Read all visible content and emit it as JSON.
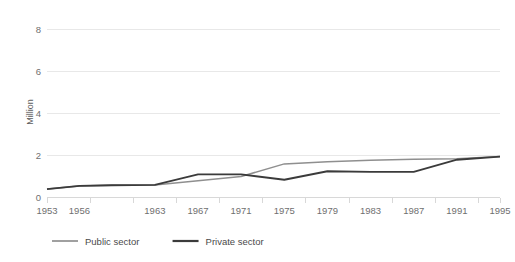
{
  "chart_data": {
    "type": "line",
    "title": "",
    "subtitle": "",
    "xlabel": "",
    "ylabel": "Million",
    "ylim": [
      0,
      8
    ],
    "yticks": [
      0,
      2,
      4,
      6,
      8
    ],
    "ytick_labels": [
      "0",
      "2",
      "4",
      "6",
      "8"
    ],
    "grid": true,
    "legend_position": "bottom-left",
    "x": [
      1953,
      1956,
      1959,
      1963,
      1967,
      1971,
      1975,
      1979,
      1983,
      1987,
      1991,
      1995
    ],
    "xtick_labels": [
      "1953",
      "1956",
      "1963",
      "1967",
      "1971",
      "1975",
      "1979",
      "1983",
      "1987",
      "1991",
      "1995"
    ],
    "xtick_values": [
      1953,
      1956,
      1963,
      1967,
      1971,
      1975,
      1979,
      1983,
      1987,
      1991,
      1995
    ],
    "series": [
      {
        "name": "Public sector",
        "color": "#8f8f8f",
        "values": [
          0.4,
          0.55,
          0.58,
          0.6,
          0.8,
          1.0,
          1.6,
          1.7,
          1.77,
          1.82,
          1.85,
          1.95
        ]
      },
      {
        "name": "Private sector",
        "color": "#3b3b3b",
        "values": [
          0.4,
          0.55,
          0.58,
          0.6,
          1.1,
          1.1,
          0.85,
          1.25,
          1.22,
          1.22,
          1.8,
          1.95
        ]
      }
    ]
  },
  "legend": {
    "items": [
      {
        "label": "Public sector",
        "color": "#8f8f8f"
      },
      {
        "label": "Private sector",
        "color": "#3b3b3b"
      }
    ]
  },
  "axes": {
    "y_title": "Million"
  }
}
